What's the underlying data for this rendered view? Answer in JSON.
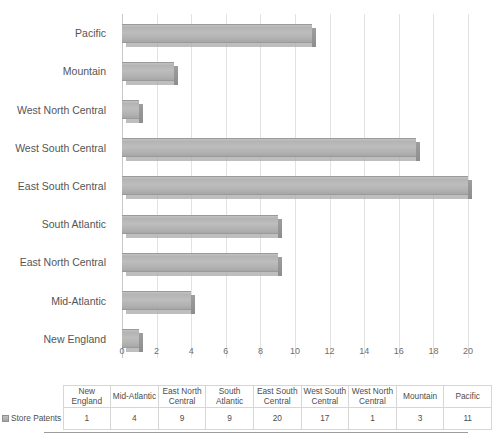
{
  "chart_data": {
    "type": "bar",
    "orientation": "horizontal",
    "title": "",
    "subtitle": "",
    "xlabel": "",
    "ylabel": "",
    "xlim": [
      0,
      20
    ],
    "xtick_step": 2,
    "xticks": [
      "0",
      "2",
      "4",
      "6",
      "8",
      "10",
      "12",
      "14",
      "16",
      "18",
      "20"
    ],
    "grid": "vertical",
    "legend_position": "data-table",
    "series_name": "Store Patents",
    "categories": [
      "New England",
      "Mid-Atlantic",
      "East North Central",
      "South Atlantic",
      "East South Central",
      "West South Central",
      "West North Central",
      "Mountain",
      "Pacific"
    ],
    "values": [
      1,
      4,
      9,
      9,
      20,
      17,
      1,
      3,
      11
    ],
    "plot_order_top_to_bottom": [
      "Pacific",
      "Mountain",
      "West North Central",
      "West South Central",
      "East South Central",
      "South Atlantic",
      "East North Central",
      "Mid-Atlantic",
      "New England"
    ],
    "values_top_to_bottom": [
      11,
      3,
      1,
      17,
      20,
      9,
      9,
      4,
      1
    ]
  },
  "data_table": {
    "corner_label": "",
    "headers": [
      "New England",
      "Mid-Atlantic",
      "East North Central",
      "South Atlantic",
      "East South Central",
      "West South Central",
      "West North Central",
      "Mountain",
      "Pacific"
    ],
    "rows": [
      {
        "label": "Store Patents",
        "swatch_icon": "legend-swatch-icon",
        "values": [
          "1",
          "4",
          "9",
          "9",
          "20",
          "17",
          "1",
          "3",
          "11"
        ]
      }
    ]
  },
  "colors": {
    "bar_fill": "#bdbdbd",
    "bar_edge": "#9a9a9a",
    "gridline": "#e2e2e2",
    "axis": "#c8c8c8",
    "text": "#555555",
    "table_border": "#d6d6d6",
    "background": "#ffffff"
  }
}
